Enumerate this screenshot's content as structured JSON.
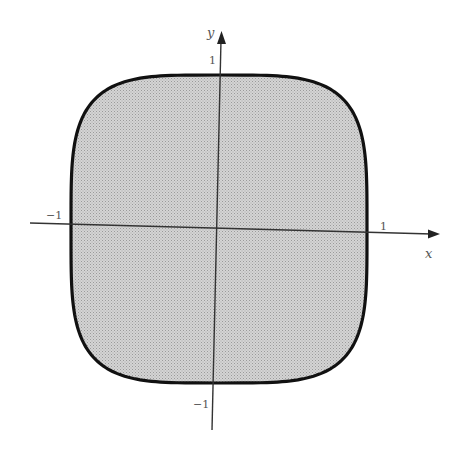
{
  "figure": {
    "region": {
      "fill_color": "#c8c8c8",
      "stroke_color": "#111111",
      "exponent": 4,
      "center_px": [
        219,
        229
      ],
      "radius_px": [
        148,
        154
      ]
    },
    "axes": {
      "x_label": "x",
      "y_label": "y",
      "axis_color": "#333333"
    },
    "ticks": {
      "x_neg": "−1",
      "x_pos": "1",
      "y_pos": "1",
      "y_neg": "−1"
    }
  }
}
